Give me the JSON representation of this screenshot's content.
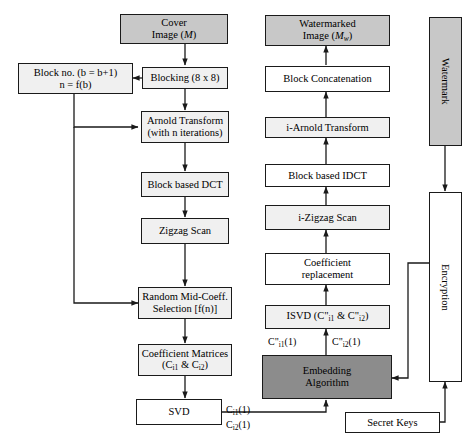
{
  "diagram": {
    "colors": {
      "box_light": "#f0f0f0",
      "box_mid": "#c8c8c8",
      "box_dark": "#8c8c8c",
      "box_white": "#ffffff",
      "stroke": "#1a1a1a"
    },
    "nodes": {
      "cover_image": {
        "line1": "Cover",
        "line2": "Image (M)"
      },
      "block_no": {
        "line1": "Block no. (b = b+1)",
        "line2": "n = f(b)"
      },
      "blocking": {
        "label": "Blocking (8 x 8)"
      },
      "arnold": {
        "line1": "Arnold Transform",
        "line2": "(with n iterations)"
      },
      "dct": {
        "label": "Block based DCT"
      },
      "zigzag": {
        "label": "Zigzag Scan"
      },
      "random_mid": {
        "line1": "Random Mid-Coeff.",
        "line2": "Selection [f(n)]"
      },
      "coeff_matrices": {
        "line1": "Coefficient Matrices",
        "line2": "(Ci1 & Ci2)"
      },
      "svd": {
        "label": "SVD"
      },
      "watermarked_image": {
        "line1": "Watermarked",
        "line2": "Image (Mw)"
      },
      "block_concat": {
        "label": "Block Concatenation"
      },
      "i_arnold": {
        "label": "i-Arnold Transform"
      },
      "idct": {
        "label": "Block based IDCT"
      },
      "i_zigzag": {
        "label": "i-Zigzag Scan"
      },
      "coeff_replacement": {
        "line1": "Coefficient",
        "line2": "replacement"
      },
      "isvd": {
        "label": "ISVD (C\"i1 & C\"i2)"
      },
      "embedding": {
        "line1": "Embedding",
        "line2": "Algorithm"
      },
      "secret_keys": {
        "label": "Secret Keys"
      },
      "watermark": {
        "label": "Watermark"
      },
      "encryption": {
        "label": "Encryption"
      }
    },
    "edge_labels": {
      "ci1_1": "Ci1(1)",
      "ci2_1": "Ci2(1)",
      "cpp_i1_1": "C\"i1(1)",
      "cpp_i2_1": "C\"i2(1)"
    }
  }
}
